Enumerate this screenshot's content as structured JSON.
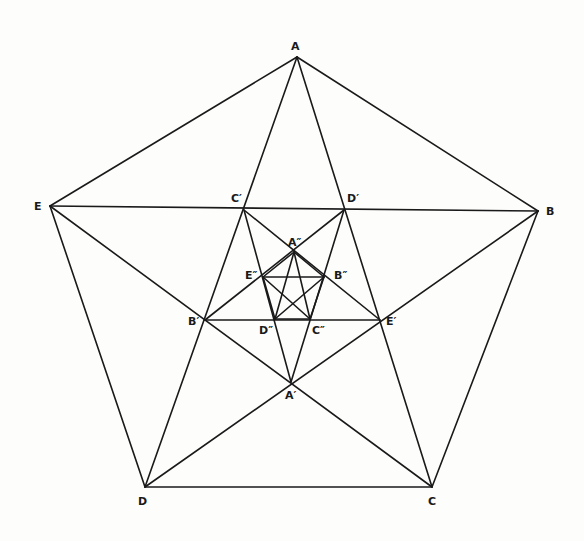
{
  "diagram": {
    "title": "",
    "stroke_color": "#1a1a1a",
    "background": "#fdfdfc",
    "points": {
      "A": {
        "x": 297,
        "y": 57
      },
      "B": {
        "x": 538,
        "y": 211
      },
      "C": {
        "x": 432,
        "y": 487
      },
      "D": {
        "x": 145,
        "y": 487
      },
      "E": {
        "x": 50,
        "y": 206
      },
      "A1": {
        "x": 291,
        "y": 382
      },
      "B1": {
        "x": 205,
        "y": 320
      },
      "C1": {
        "x": 244,
        "y": 210
      },
      "D1": {
        "x": 344,
        "y": 210
      },
      "E1": {
        "x": 380,
        "y": 320
      },
      "A2": {
        "x": 294,
        "y": 252
      },
      "B2": {
        "x": 324,
        "y": 277
      },
      "C2": {
        "x": 310,
        "y": 319
      },
      "D2": {
        "x": 275,
        "y": 319
      },
      "E2": {
        "x": 263,
        "y": 277
      }
    },
    "labels": [
      {
        "id": "A",
        "text": "A",
        "x": 291,
        "y": 41
      },
      {
        "id": "B",
        "text": "B",
        "x": 546,
        "y": 206
      },
      {
        "id": "C",
        "text": "C",
        "x": 428,
        "y": 496
      },
      {
        "id": "D",
        "text": "D",
        "x": 138,
        "y": 496
      },
      {
        "id": "E",
        "text": "E",
        "x": 34,
        "y": 201
      },
      {
        "id": "A1",
        "text": "A′",
        "x": 285,
        "y": 390
      },
      {
        "id": "B1",
        "text": "B′",
        "x": 188,
        "y": 316
      },
      {
        "id": "C1",
        "text": "C′",
        "x": 231,
        "y": 193
      },
      {
        "id": "D1",
        "text": "D′",
        "x": 347,
        "y": 193
      },
      {
        "id": "E1",
        "text": "E′",
        "x": 386,
        "y": 316
      },
      {
        "id": "A2",
        "text": "A″",
        "x": 288,
        "y": 237
      },
      {
        "id": "B2",
        "text": "B″",
        "x": 334,
        "y": 270
      },
      {
        "id": "C2",
        "text": "C″",
        "x": 312,
        "y": 325
      },
      {
        "id": "D2",
        "text": "D″",
        "x": 259,
        "y": 325
      },
      {
        "id": "E2",
        "text": "E″",
        "x": 245,
        "y": 270
      }
    ]
  }
}
